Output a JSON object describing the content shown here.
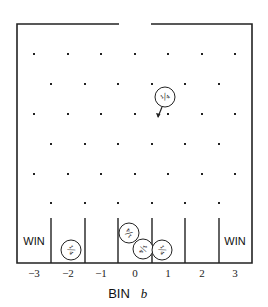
{
  "diagram": {
    "type": "galton-board",
    "frame": {
      "left": 17,
      "right": 252,
      "top": 24,
      "bottom": 263,
      "gap_left": 119,
      "gap_right": 151
    },
    "peg_rows": [
      {
        "y": 54,
        "xs": [
          34,
          68,
          101,
          135,
          168,
          202,
          235
        ]
      },
      {
        "y": 84,
        "xs": [
          51,
          85,
          118,
          152,
          185,
          219
        ]
      },
      {
        "y": 114,
        "xs": [
          34,
          68,
          101,
          135,
          168,
          202,
          235
        ]
      },
      {
        "y": 144,
        "xs": [
          51,
          85,
          118,
          152,
          185,
          219
        ]
      },
      {
        "y": 174,
        "xs": [
          34,
          68,
          101,
          135,
          168,
          202,
          235
        ]
      },
      {
        "y": 203,
        "xs": [
          51,
          85,
          118,
          152,
          185,
          219
        ]
      }
    ],
    "dividers": {
      "top": 218,
      "xs": [
        51,
        85,
        118,
        152,
        185,
        219
      ]
    },
    "bins": [
      {
        "label": "−3",
        "x": 34,
        "win": true,
        "win_label": "WIN"
      },
      {
        "label": "−2",
        "x": 68,
        "win": false
      },
      {
        "label": "−1",
        "x": 101,
        "win": false
      },
      {
        "label": "0",
        "x": 135,
        "win": false
      },
      {
        "label": "1",
        "x": 168,
        "win": false
      },
      {
        "label": "2",
        "x": 202,
        "win": false
      },
      {
        "label": "3",
        "x": 235,
        "win": true,
        "win_label": "WIN"
      }
    ],
    "coins": [
      {
        "name": "falling-coin",
        "cx": 165,
        "cy": 97,
        "r": 10,
        "face": "¼",
        "rotate": -30
      },
      {
        "name": "coin-bin-minus-2",
        "cx": 71,
        "cy": 250,
        "r": 10,
        "face": "¼",
        "rotate": 60
      },
      {
        "name": "coin-bin-0-upper",
        "cx": 129,
        "cy": 233,
        "r": 10,
        "face": "¼",
        "rotate": 225
      },
      {
        "name": "coin-bin-0-lower",
        "cx": 143,
        "cy": 249,
        "r": 10,
        "face": "¼",
        "rotate": 100
      },
      {
        "name": "coin-bin-1",
        "cx": 162,
        "cy": 250,
        "r": 10,
        "face": "¼",
        "rotate": 60
      }
    ],
    "arrow": {
      "x1": 162,
      "y1": 107,
      "x2": 158,
      "y2": 117
    },
    "axis": {
      "label": "BIN",
      "variable": "b"
    }
  }
}
